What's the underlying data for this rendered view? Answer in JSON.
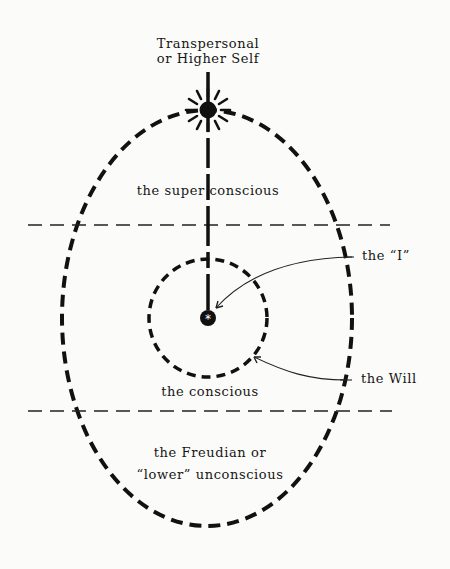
{
  "diagram": {
    "top_label": {
      "line1": "Transpersonal",
      "line2": "or Higher Self"
    },
    "regions": {
      "superconscious": "the super conscious",
      "conscious": "the conscious",
      "lower_unconscious": {
        "line1": "the Freudian or",
        "line2": "“lower” unconscious"
      }
    },
    "callouts": {
      "self": "the “I”",
      "will": "the Will"
    },
    "center_symbol": "*",
    "colors": {
      "ink": "#111111",
      "background": "#fbfbf9"
    }
  }
}
